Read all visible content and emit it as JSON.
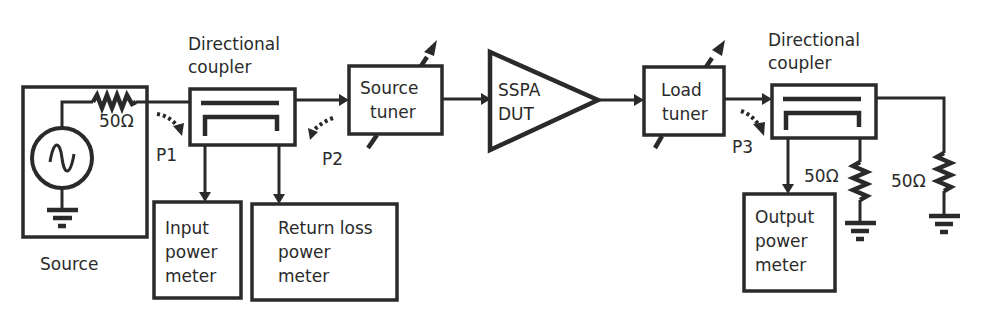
{
  "figure": {
    "type": "block-diagram",
    "colors": {
      "line": "#2a2a2a",
      "background": "#ffffff"
    }
  },
  "blocks": {
    "source": {
      "label": "Source",
      "resistor": "50Ω"
    },
    "coupler_in": {
      "label_line1": "Directional",
      "label_line2": "coupler"
    },
    "input_meter": {
      "line1": "Input",
      "line2": "power",
      "line3": "meter"
    },
    "return_meter": {
      "line1": "Return loss",
      "line2": "power",
      "line3": "meter"
    },
    "source_tuner": {
      "line1": "Source",
      "line2": "tuner"
    },
    "dut": {
      "line1": "SSPA",
      "line2": "DUT"
    },
    "load_tuner": {
      "line1": "Load",
      "line2": "tuner"
    },
    "coupler_out": {
      "label_line1": "Directional",
      "label_line2": "coupler"
    },
    "output_meter": {
      "line1": "Output",
      "line2": "power",
      "line3": "meter"
    },
    "termination_coupler": {
      "resistor": "50Ω"
    },
    "termination_load": {
      "resistor": "50Ω"
    }
  },
  "ports": {
    "p1": "P1",
    "p2": "P2",
    "p3": "P3"
  }
}
